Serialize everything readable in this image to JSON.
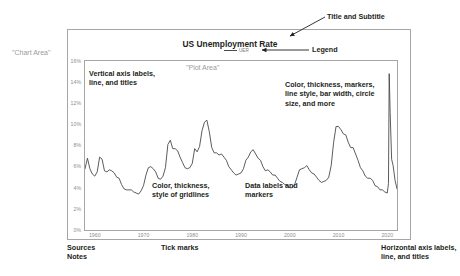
{
  "chart_data": {
    "type": "line",
    "title": "US Unemployment Rate",
    "subtitle": "",
    "xlabel": "",
    "ylabel": "",
    "legend": [
      {
        "name": "UER",
        "color": "#4a4a4a"
      }
    ],
    "legend_position": "top-center",
    "grid": false,
    "xlim": [
      1958,
      2022
    ],
    "ylim": [
      0,
      16
    ],
    "y_tick_labels": [
      "0%",
      "2%",
      "4%",
      "6%",
      "8%",
      "10%",
      "12%",
      "14%",
      "16%"
    ],
    "y_tick_values": [
      0,
      2,
      4,
      6,
      8,
      10,
      12,
      14,
      16
    ],
    "x_tick_labels": [
      "1960",
      "1970",
      "1980",
      "1990",
      "2000",
      "2010",
      "2020"
    ],
    "x_tick_values": [
      1960,
      1970,
      1980,
      1990,
      2000,
      2010,
      2020
    ],
    "series": [
      {
        "name": "UER",
        "color": "#4a4a4a",
        "x": [
          1958.0,
          1958.5,
          1959.0,
          1959.5,
          1960.0,
          1960.5,
          1961.0,
          1961.5,
          1962.0,
          1962.5,
          1963.0,
          1963.5,
          1964.0,
          1964.5,
          1965.0,
          1965.5,
          1966.0,
          1966.5,
          1967.0,
          1967.5,
          1968.0,
          1968.5,
          1969.0,
          1969.5,
          1970.0,
          1970.5,
          1971.0,
          1971.5,
          1972.0,
          1972.5,
          1973.0,
          1973.5,
          1974.0,
          1974.5,
          1975.0,
          1975.5,
          1976.0,
          1976.5,
          1977.0,
          1977.5,
          1978.0,
          1978.5,
          1979.0,
          1979.5,
          1980.0,
          1980.5,
          1981.0,
          1981.5,
          1982.0,
          1982.5,
          1983.0,
          1983.5,
          1984.0,
          1984.5,
          1985.0,
          1985.5,
          1986.0,
          1986.5,
          1987.0,
          1987.5,
          1988.0,
          1988.5,
          1989.0,
          1989.5,
          1990.0,
          1990.5,
          1991.0,
          1991.5,
          1992.0,
          1992.5,
          1993.0,
          1993.5,
          1994.0,
          1994.5,
          1995.0,
          1995.5,
          1996.0,
          1996.5,
          1997.0,
          1997.5,
          1998.0,
          1998.5,
          1999.0,
          1999.5,
          2000.0,
          2000.5,
          2001.0,
          2001.5,
          2002.0,
          2002.5,
          2003.0,
          2003.5,
          2004.0,
          2004.5,
          2005.0,
          2005.5,
          2006.0,
          2006.5,
          2007.0,
          2007.5,
          2008.0,
          2008.5,
          2009.0,
          2009.5,
          2010.0,
          2010.5,
          2011.0,
          2011.5,
          2012.0,
          2012.5,
          2013.0,
          2013.5,
          2014.0,
          2014.5,
          2015.0,
          2015.5,
          2016.0,
          2016.5,
          2017.0,
          2017.5,
          2018.0,
          2018.5,
          2019.0,
          2019.5,
          2020.0,
          2020.25,
          2020.4,
          2020.6,
          2020.9,
          2021.2,
          2021.6,
          2022.0
        ],
        "y": [
          5.8,
          6.8,
          5.8,
          5.3,
          5.1,
          5.5,
          6.9,
          6.7,
          5.6,
          5.5,
          5.7,
          5.6,
          5.4,
          5.0,
          4.9,
          4.3,
          3.9,
          3.8,
          3.8,
          3.8,
          3.6,
          3.5,
          3.4,
          3.7,
          4.2,
          5.2,
          5.9,
          6.0,
          5.8,
          5.5,
          4.9,
          4.8,
          5.1,
          5.9,
          8.1,
          8.5,
          7.7,
          7.7,
          7.5,
          6.9,
          6.4,
          5.9,
          5.8,
          5.9,
          6.3,
          7.7,
          7.4,
          7.9,
          9.4,
          10.2,
          10.4,
          9.3,
          7.8,
          7.3,
          7.3,
          7.1,
          7.2,
          6.9,
          6.6,
          6.0,
          5.7,
          5.4,
          5.2,
          5.3,
          5.4,
          5.8,
          6.6,
          6.9,
          7.4,
          7.6,
          7.2,
          6.8,
          6.6,
          6.0,
          5.6,
          5.7,
          5.5,
          5.2,
          5.2,
          4.9,
          4.6,
          4.5,
          4.3,
          4.2,
          4.0,
          4.0,
          4.3,
          5.0,
          5.7,
          5.8,
          5.9,
          6.1,
          5.7,
          5.4,
          5.3,
          5.0,
          4.7,
          4.5,
          4.6,
          4.7,
          5.0,
          6.1,
          8.3,
          9.8,
          9.8,
          9.5,
          9.1,
          9.0,
          8.3,
          7.8,
          7.8,
          7.2,
          6.6,
          5.9,
          5.6,
          5.1,
          4.9,
          4.9,
          4.7,
          4.2,
          4.1,
          3.8,
          3.8,
          3.6,
          3.5,
          4.4,
          14.8,
          11.1,
          6.7,
          6.1,
          4.7,
          3.9
        ]
      }
    ]
  },
  "labels": {
    "chart_title": "US Unemployment Rate",
    "legend_series": "UER",
    "chart_area": "\"Chart Area\"",
    "plot_area": "\"Plot Area\""
  },
  "annotations": [
    {
      "id": "title",
      "text": "Title and Subtitle"
    },
    {
      "id": "legend",
      "text": "Legend"
    },
    {
      "id": "chart_area",
      "text": "\"Chart Area\""
    },
    {
      "id": "plot_area",
      "text": "\"Plot Area\""
    },
    {
      "id": "vertical",
      "text": "Vertical axis labels,\nline, and titles"
    },
    {
      "id": "style",
      "text": "Color, thickness, markers,\nline style, bar width, circle\nsize, and more"
    },
    {
      "id": "gridlines",
      "text": "Color, thickness,\nstyle of gridlines"
    },
    {
      "id": "datalabels",
      "text": "Data labels and\nmarkers"
    },
    {
      "id": "sources",
      "text": "Sources\nNotes"
    },
    {
      "id": "tickmarks",
      "text": "Tick marks"
    },
    {
      "id": "horizontal",
      "text": "Horizontal axis labels,\nline, and titles"
    }
  ],
  "colors": {
    "line": "#4a4a4a",
    "frame": "#a6a6a6",
    "axis_text": "#8e8e8e",
    "annotation_text": "#231f20",
    "area_label_text": "#9b9b9b",
    "background": "#ffffff"
  }
}
